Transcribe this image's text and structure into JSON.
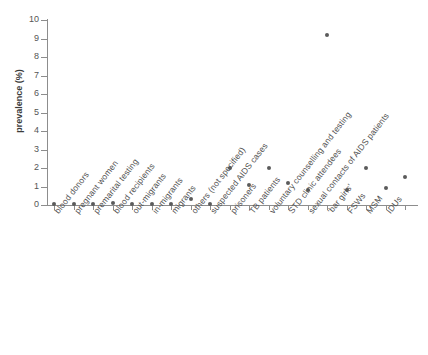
{
  "chart_data": {
    "type": "scatter",
    "title": "",
    "xlabel": "",
    "ylabel": "prevalence (%)",
    "ylim": [
      0,
      10
    ],
    "yticks": [
      0,
      1,
      2,
      3,
      4,
      5,
      6,
      7,
      8,
      9,
      10
    ],
    "ytick_labels": [
      "0",
      "1",
      "2",
      "3",
      "4",
      "5",
      "6",
      "7",
      "8",
      "9",
      "10"
    ],
    "grid": false,
    "legend": null,
    "marker": {
      "shape": "circle",
      "color": "#5b5b5b",
      "size": 4
    },
    "categories": [
      "blood donors",
      "pregnant women",
      "premarital testing",
      "blood recipients",
      "out-migrants",
      "in-migrants",
      "migrants",
      "others (not specified)",
      "suspected AIDS cases",
      "prisoners",
      "TB patients",
      "voluntary counselling and testing",
      "STD clinic attendees",
      "sexual contacts of AIDS patients",
      "‘bar girls’",
      "FSWs",
      "MSM",
      "IDUs"
    ],
    "values": [
      0.05,
      0.05,
      0.05,
      0.1,
      0.05,
      0.05,
      0.05,
      0.3,
      0.05,
      2.0,
      1.1,
      2.0,
      1.2,
      0.8,
      9.2,
      0.8,
      2.0,
      0.9
    ],
    "extra_point": {
      "category_index": 18,
      "value": 1.5,
      "label": "IDUs"
    }
  },
  "axis": {
    "y_title": "prevalence (%)"
  }
}
